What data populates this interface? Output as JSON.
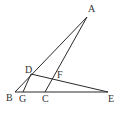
{
  "diagram": {
    "type": "geometry-triangle",
    "points": {
      "A": {
        "label": "A",
        "x": 87,
        "y": 17,
        "lx": 88,
        "ly": 12
      },
      "B": {
        "label": "B",
        "x": 15,
        "y": 92,
        "lx": 6,
        "ly": 101
      },
      "G": {
        "label": "G",
        "x": 23,
        "y": 92,
        "lx": 19,
        "ly": 102
      },
      "C": {
        "label": "C",
        "x": 45,
        "y": 92,
        "lx": 42,
        "ly": 102
      },
      "E": {
        "label": "E",
        "x": 108,
        "y": 92,
        "lx": 108,
        "ly": 102
      },
      "D": {
        "label": "D",
        "x": 31,
        "y": 74,
        "lx": 25,
        "ly": 73
      },
      "F": {
        "label": "F",
        "x": 54,
        "y": 81,
        "lx": 57,
        "ly": 78
      }
    },
    "segments": [
      {
        "from": "A",
        "to": "B"
      },
      {
        "from": "A",
        "to": "C"
      },
      {
        "from": "B",
        "to": "E"
      },
      {
        "from": "D",
        "to": "E"
      },
      {
        "from": "D",
        "to": "G"
      }
    ],
    "stroke_color": "#2a2a2a",
    "label_color": "#333333"
  }
}
